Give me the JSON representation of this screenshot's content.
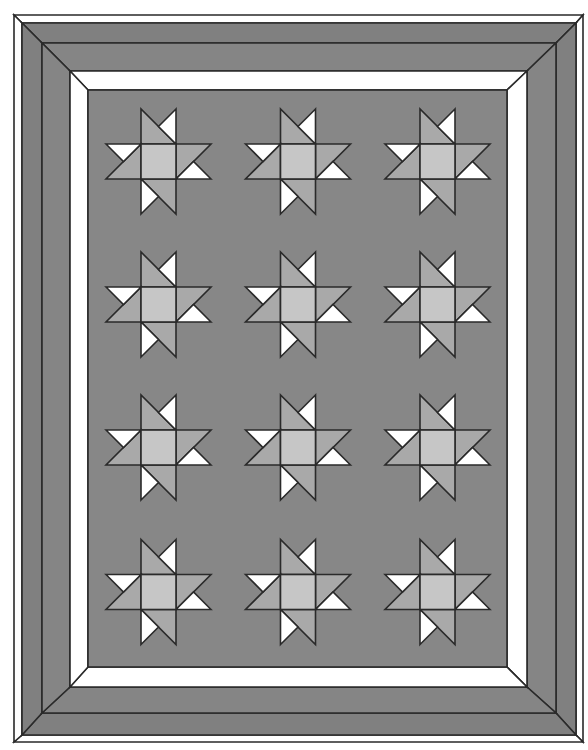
{
  "diagram": {
    "type": "quilt-layout",
    "block_name": "pinwheel-star",
    "grid": {
      "columns": 3,
      "rows": 4
    },
    "canvas": {
      "width": 588,
      "height": 750,
      "background": "#ffffff"
    },
    "colors": {
      "outline": "#2a2a2a",
      "field": "#878787",
      "border_dark_outer": "#808080",
      "border_dark_inner": "#858585",
      "border_light": "#ffffff",
      "star_points": "#a9a9a9",
      "star_center": "#c6c6c6",
      "star_accent": "#ffffff"
    },
    "frame": {
      "bands": [
        {
          "name": "outer-white-strip",
          "left": 14,
          "top": 15,
          "right": 583,
          "bottom": 742,
          "fill": "#ffffff"
        },
        {
          "name": "outer-dark-border",
          "left": 22,
          "top": 23,
          "right": 576,
          "bottom": 735,
          "fill": "#808080"
        },
        {
          "name": "inner-dark-border",
          "left": 42,
          "top": 43,
          "right": 556,
          "bottom": 713,
          "fill": "#858585"
        },
        {
          "name": "white-border",
          "left": 70,
          "top": 71,
          "right": 527,
          "bottom": 687,
          "fill": "#ffffff"
        }
      ],
      "field": {
        "left": 88,
        "top": 90,
        "right": 507,
        "bottom": 667,
        "fill": "#878787"
      }
    },
    "star": {
      "unit": 35,
      "column_centers": [
        158.5,
        298,
        437.5
      ],
      "row_centers": [
        161.5,
        304.5,
        447.5,
        592
      ]
    }
  }
}
